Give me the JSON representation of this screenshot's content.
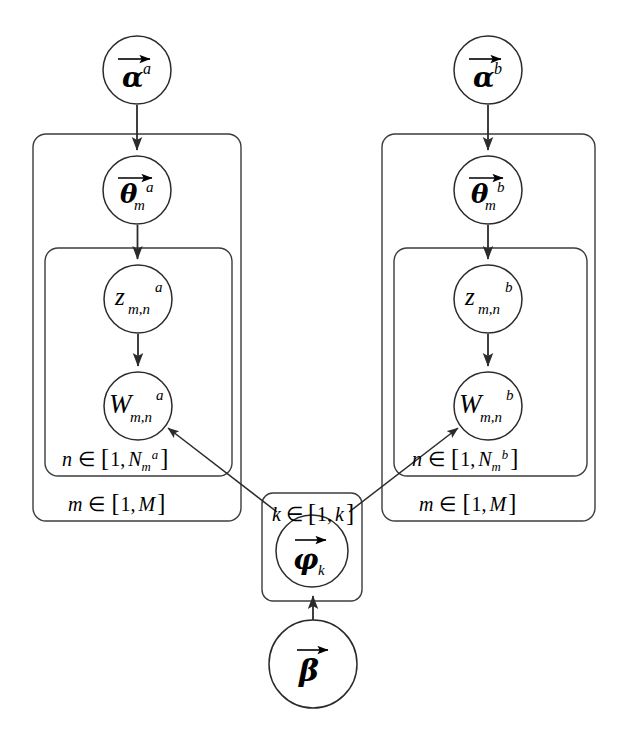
{
  "figure": {
    "type": "plate-notation-graphical-model",
    "background_color": "#ffffff",
    "stroke_color": "#2b2b2b",
    "plate_stroke_color": "#3c3c3c"
  },
  "nodes": [
    {
      "id": "alpha-a",
      "symbol": "α",
      "superscript": "a",
      "subscript": "",
      "vector": true,
      "cx": 137,
      "cy": 70,
      "r": 34,
      "label": "alpha-a"
    },
    {
      "id": "theta-a",
      "symbol": "θ",
      "superscript": "a",
      "subscript": "m",
      "vector": true,
      "cx": 137,
      "cy": 190,
      "r": 34,
      "label": "theta-m-a"
    },
    {
      "id": "z-a",
      "symbol": "z",
      "superscript": "a",
      "subscript": "m,n",
      "vector": false,
      "cx": 138,
      "cy": 299,
      "r": 34,
      "label": "z-m-n-a"
    },
    {
      "id": "w-a",
      "symbol": "W",
      "superscript": "a",
      "subscript": "m,n",
      "vector": false,
      "cx": 138,
      "cy": 406,
      "r": 34,
      "label": "w-m-n-a"
    },
    {
      "id": "alpha-b",
      "symbol": "α",
      "superscript": "b",
      "subscript": "",
      "vector": true,
      "cx": 488,
      "cy": 70,
      "r": 34,
      "label": "alpha-b"
    },
    {
      "id": "theta-b",
      "symbol": "θ",
      "superscript": "b",
      "subscript": "m",
      "vector": true,
      "cx": 488,
      "cy": 190,
      "r": 34,
      "label": "theta-m-b"
    },
    {
      "id": "z-b",
      "symbol": "z",
      "superscript": "b",
      "subscript": "m,n",
      "vector": false,
      "cx": 488,
      "cy": 299,
      "r": 34,
      "label": "z-m-n-b"
    },
    {
      "id": "w-b",
      "symbol": "W",
      "superscript": "b",
      "subscript": "m,n",
      "vector": false,
      "cx": 488,
      "cy": 406,
      "r": 34,
      "label": "w-m-n-b"
    },
    {
      "id": "phi-k",
      "symbol": "φ",
      "superscript": "",
      "subscript": "k",
      "vector": true,
      "cx": 312,
      "cy": 551,
      "r": 36,
      "label": "phi-k"
    },
    {
      "id": "beta",
      "symbol": "β",
      "superscript": "",
      "subscript": "",
      "vector": true,
      "cx": 313,
      "cy": 664,
      "r": 44,
      "label": "beta"
    }
  ],
  "plates": [
    {
      "id": "plate-m-a",
      "x": 33,
      "y": 134,
      "w": 208,
      "h": 387,
      "rx": 13,
      "label": "m ∈ [1, M]",
      "label_var": "m",
      "label_lo": "1",
      "label_hi": "M",
      "label_x": 138,
      "label_y": 504
    },
    {
      "id": "plate-n-a",
      "x": 45,
      "y": 248,
      "w": 187,
      "h": 228,
      "rx": 13,
      "label": "n ∈ [1, Nₘᵃ]",
      "label_var": "n",
      "label_lo": "1",
      "label_hi": "N",
      "label_hi_sub": "m",
      "label_hi_sup": "a",
      "label_x": 138,
      "label_y": 459
    },
    {
      "id": "plate-m-b",
      "x": 382,
      "y": 134,
      "w": 213,
      "h": 387,
      "rx": 13,
      "label": "m ∈ [1, M]",
      "label_var": "m",
      "label_lo": "1",
      "label_hi": "M",
      "label_x": 489,
      "label_y": 504
    },
    {
      "id": "plate-n-b",
      "x": 394,
      "y": 248,
      "w": 193,
      "h": 228,
      "rx": 13,
      "label": "n ∈ [1, Nₘᵇ]",
      "label_var": "n",
      "label_lo": "1",
      "label_hi": "N",
      "label_hi_sub": "m",
      "label_hi_sup": "b",
      "label_x": 489,
      "label_y": 459
    },
    {
      "id": "plate-k",
      "x": 262,
      "y": 493,
      "w": 100,
      "h": 108,
      "rx": 11,
      "label": "k ∈ [1, k]",
      "label_var": "k",
      "label_lo": "1",
      "label_hi": "k",
      "label_x": 312,
      "label_y": 516
    }
  ],
  "edges": [
    {
      "id": "e-alpha-a-theta-a",
      "from": "alpha-a",
      "to": "theta-a",
      "kind": "vertical"
    },
    {
      "id": "e-theta-a-z-a",
      "from": "theta-a",
      "to": "z-a",
      "kind": "vertical"
    },
    {
      "id": "e-z-a-w-a",
      "from": "z-a",
      "to": "w-a",
      "kind": "vertical"
    },
    {
      "id": "e-alpha-b-theta-b",
      "from": "alpha-b",
      "to": "theta-b",
      "kind": "vertical"
    },
    {
      "id": "e-theta-b-z-b",
      "from": "theta-b",
      "to": "z-b",
      "kind": "vertical"
    },
    {
      "id": "e-z-b-w-b",
      "from": "z-b",
      "to": "w-b",
      "kind": "vertical"
    },
    {
      "id": "e-phi-w-a",
      "from": "plate-k",
      "to": "w-a",
      "kind": "diagonal"
    },
    {
      "id": "e-phi-w-b",
      "from": "plate-k",
      "to": "w-b",
      "kind": "diagonal"
    },
    {
      "id": "e-beta-phi",
      "from": "beta",
      "to": "phi-k",
      "kind": "vertical"
    }
  ],
  "glyphs": {
    "alpha": "α",
    "beta": "β",
    "theta": "θ",
    "phi": "φ",
    "element_of": "∈",
    "bracket_open": "[",
    "bracket_close": "]",
    "comma": ","
  },
  "text_labels": {
    "m_range": "m ∈ [1, M]",
    "n_range_a": "n ∈ [1, N m a]",
    "n_range_b": "n ∈ [1, N m b]",
    "k_range": "k ∈ [1, k]",
    "superscript_a": "a",
    "superscript_b": "b",
    "subscript_m": "m",
    "subscript_mn": "m,n",
    "subscript_k": "k",
    "M": "M",
    "one": "1",
    "N": "N",
    "k": "k"
  }
}
